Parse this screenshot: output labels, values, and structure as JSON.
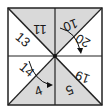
{
  "diagram": {
    "type": "folded-square-puzzle",
    "colors": {
      "shade": "#d9d9d9",
      "paper": "#ffffff",
      "line": "#222222"
    },
    "triangles": [
      {
        "id": "t11",
        "label": "11",
        "shaded": true,
        "rotation": 180
      },
      {
        "id": "t10",
        "label": "10",
        "shaded": true,
        "rotation": 160
      },
      {
        "id": "t20",
        "label": "20",
        "shaded": false,
        "rotation": 200
      },
      {
        "id": "t19",
        "label": "19",
        "shaded": false,
        "rotation": 200
      },
      {
        "id": "t5",
        "label": "5",
        "shaded": true,
        "rotation": 160
      },
      {
        "id": "t4",
        "label": "4",
        "shaded": true,
        "rotation": -20
      },
      {
        "id": "t14",
        "label": "14",
        "shaded": false,
        "rotation": 30
      },
      {
        "id": "t13",
        "label": "13",
        "shaded": false,
        "rotation": 30
      }
    ],
    "arrows": [
      {
        "from": "10",
        "to": "20",
        "icon": "curved-arrow"
      },
      {
        "from": "14",
        "to": "4",
        "icon": "curved-arrow"
      }
    ]
  }
}
